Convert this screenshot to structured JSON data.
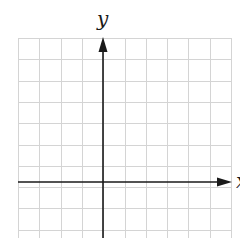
{
  "diagram": {
    "type": "coordinate-plane",
    "x_axis_label": "x",
    "y_axis_label": "y",
    "grid": {
      "left": 18,
      "top": 38,
      "right": 231,
      "bottom": 238,
      "cell_size": 21.3,
      "columns": 10,
      "rows_visible": 9.4,
      "line_color": "#d4d4d4"
    },
    "axes": {
      "origin_x": 103,
      "origin_y": 182,
      "color": "#1a1a1a",
      "x_arrow_tip": 232,
      "y_arrow_tip": 37
    }
  }
}
